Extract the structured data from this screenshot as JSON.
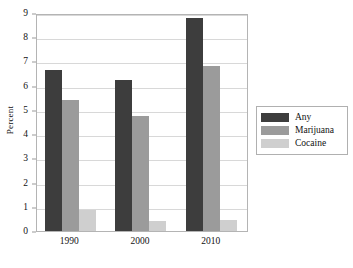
{
  "chart_data": {
    "type": "bar",
    "title": "",
    "subtitle": "",
    "xlabel": "",
    "ylabel": "Percent",
    "categories": [
      "1990",
      "2000",
      "2010"
    ],
    "series": [
      {
        "name": "Any",
        "color": "#3d3d3d",
        "values": [
          6.65,
          6.25,
          8.8
        ]
      },
      {
        "name": "Marijuana",
        "color": "#9b9b9b",
        "values": [
          5.4,
          4.75,
          6.8
        ]
      },
      {
        "name": "Cocaine",
        "color": "#cfcfcf",
        "values": [
          0.88,
          0.42,
          0.47
        ]
      }
    ],
    "ylim": [
      0,
      9
    ],
    "yticks": [
      0,
      1,
      2,
      3,
      4,
      5,
      6,
      7,
      8,
      9
    ],
    "ytick_labels": [
      "0",
      "1",
      "2",
      "3",
      "4",
      "5",
      "6",
      "7",
      "8",
      "9"
    ],
    "grid": true,
    "grid_axis": "y",
    "legend_position": "right-outside",
    "legend_entries": [
      "Any",
      "Marijuana",
      "Cocaine"
    ],
    "annotations": []
  },
  "axes": {
    "y_title": "Percent"
  }
}
